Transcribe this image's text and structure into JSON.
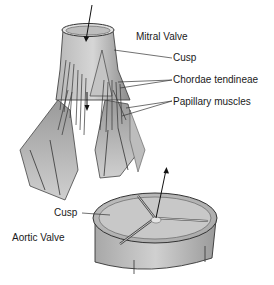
{
  "diagram": {
    "mitral": {
      "title": "Mitral Valve",
      "labels": {
        "cusp": "Cusp",
        "chordae": "Chordae tendineae",
        "papillary": "Papillary muscles"
      }
    },
    "aortic": {
      "title": "Aortic Valve",
      "labels": {
        "cusp": "Cusp"
      }
    },
    "colors": {
      "ink": "#1a1a1a",
      "tissue_light": "#cfcfcf",
      "tissue_mid": "#a8a8a8",
      "tissue_dark": "#6e6e6e",
      "background": "#ffffff"
    }
  }
}
